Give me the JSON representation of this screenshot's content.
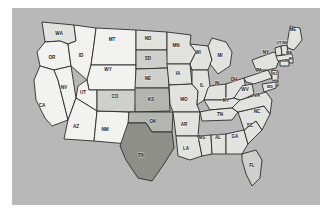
{
  "figure": {
    "kind": "us-choropleth-map",
    "background_color": "#ffffff",
    "panel_color": "#b8b8b8",
    "border_color": "#2b2b2b"
  },
  "chart_data": {
    "type": "heatmap",
    "title": "",
    "xlabel": "",
    "ylabel": "",
    "projection": "usa-albers",
    "grid": false,
    "legend_position": "none",
    "shade_palette": {
      "level0": "#f2f2f0",
      "level1": "#e2e2df",
      "level2": "#cfcfcb",
      "level3": "#b5b5b0",
      "level4": "#8f8f8a"
    },
    "categories": [
      "WA",
      "OR",
      "CA",
      "NV",
      "ID",
      "MT",
      "WY",
      "UT",
      "AZ",
      "NM",
      "CO",
      "ND",
      "SD",
      "NE",
      "KS",
      "OK",
      "TX",
      "MN",
      "IA",
      "MO",
      "AR",
      "LA",
      "WI",
      "IL",
      "MI",
      "IN",
      "OH",
      "KY",
      "TN",
      "MS",
      "AL",
      "GA",
      "FL",
      "SC",
      "NC",
      "VA",
      "WV",
      "PA",
      "NY",
      "VT",
      "NH",
      "ME",
      "MA",
      "RI",
      "CT",
      "NJ",
      "DE",
      "MD"
    ],
    "values": [
      1,
      0,
      0,
      0,
      0,
      0,
      0,
      0,
      0,
      0,
      2,
      1,
      2,
      2,
      3,
      3,
      4,
      1,
      1,
      1,
      1,
      1,
      1,
      1,
      1,
      1,
      1,
      1,
      1,
      1,
      1,
      1,
      2,
      1,
      1,
      1,
      1,
      1,
      1,
      1,
      1,
      1,
      1,
      1,
      1,
      1,
      1,
      1
    ],
    "labels": {
      "WA": "WA",
      "OR": "OR",
      "CA": "CA",
      "NV": "NV",
      "ID": "ID",
      "MT": "MT",
      "WY": "WY",
      "UT": "UT",
      "AZ": "AZ",
      "NM": "NM",
      "CO": "CO",
      "ND": "ND",
      "SD": "SD",
      "NE": "NE",
      "KS": "KS",
      "OK": "OK",
      "TX": "TX",
      "MN": "MN",
      "IA": "IA",
      "MO": "MO",
      "AR": "AR",
      "LA": "LA",
      "WI": "WI",
      "IL": "IL",
      "MI": "MI",
      "IN": "IN",
      "OH": "OH",
      "KY": "KY",
      "TN": "TN",
      "MS": "MS",
      "AL": "AL",
      "GA": "GA",
      "FL": "FL",
      "SC": "SC",
      "NC": "NC",
      "VA": "VA",
      "WV": "WV",
      "PA": "PA",
      "NY": "NY",
      "VT": "VT",
      "NH": "NH",
      "ME": "ME",
      "MA": "MA",
      "RI": "RI",
      "CT": "CT",
      "NJ": "NJ",
      "DE": "DE",
      "MD": "MD"
    }
  },
  "map": {
    "region_label": "United States",
    "states": [
      {
        "code": "WA",
        "label": "WA",
        "level": 1,
        "lx": 47,
        "ly": 26
      },
      {
        "code": "OR",
        "label": "OR",
        "level": 0,
        "lx": 40,
        "ly": 50
      },
      {
        "code": "CA",
        "label": "CA",
        "level": 0,
        "lx": 30,
        "ly": 98
      },
      {
        "code": "NV",
        "label": "NV",
        "level": 0,
        "lx": 52,
        "ly": 80
      },
      {
        "code": "ID",
        "label": "ID",
        "level": 0,
        "lx": 69,
        "ly": 48
      },
      {
        "code": "MT",
        "label": "MT",
        "level": 0,
        "lx": 100,
        "ly": 32
      },
      {
        "code": "WY",
        "label": "WY",
        "level": 0,
        "lx": 96,
        "ly": 62
      },
      {
        "code": "UT",
        "label": "UT",
        "level": 0,
        "lx": 71,
        "ly": 85
      },
      {
        "code": "AZ",
        "label": "AZ",
        "level": 0,
        "lx": 64,
        "ly": 119
      },
      {
        "code": "NM",
        "label": "NM",
        "level": 0,
        "lx": 93,
        "ly": 122
      },
      {
        "code": "CO",
        "label": "CO",
        "level": 2,
        "lx": 103,
        "ly": 89
      },
      {
        "code": "ND",
        "label": "ND",
        "level": 1,
        "lx": 136,
        "ly": 31
      },
      {
        "code": "SD",
        "label": "SD",
        "level": 2,
        "lx": 136,
        "ly": 51
      },
      {
        "code": "NE",
        "label": "NE",
        "level": 2,
        "lx": 136,
        "ly": 71
      },
      {
        "code": "KS",
        "label": "KS",
        "level": 3,
        "lx": 139,
        "ly": 92
      },
      {
        "code": "OK",
        "label": "OK",
        "level": 3,
        "lx": 141,
        "ly": 114
      },
      {
        "code": "TX",
        "label": "TX",
        "level": 4,
        "lx": 129,
        "ly": 148
      },
      {
        "code": "MN",
        "label": "MN",
        "level": 1,
        "lx": 164,
        "ly": 38
      },
      {
        "code": "IA",
        "label": "IA",
        "level": 1,
        "lx": 166,
        "ly": 66
      },
      {
        "code": "MO",
        "label": "MO",
        "level": 1,
        "lx": 172,
        "ly": 92
      },
      {
        "code": "AR",
        "label": "AR",
        "level": 1,
        "lx": 172,
        "ly": 117
      },
      {
        "code": "LA",
        "label": "LA",
        "level": 1,
        "lx": 174,
        "ly": 141
      },
      {
        "code": "WI",
        "label": "WI",
        "level": 1,
        "lx": 186,
        "ly": 45
      },
      {
        "code": "IL",
        "label": "IL",
        "level": 1,
        "lx": 190,
        "ly": 78
      },
      {
        "code": "MI",
        "label": "MI",
        "level": 1,
        "lx": 208,
        "ly": 48
      },
      {
        "code": "IN",
        "label": "IN",
        "level": 1,
        "lx": 205,
        "ly": 76
      },
      {
        "code": "OH",
        "label": "OH",
        "level": 1,
        "lx": 222,
        "ly": 72
      },
      {
        "code": "KY",
        "label": "KY",
        "level": 1,
        "lx": 214,
        "ly": 93
      },
      {
        "code": "TN",
        "label": "TN",
        "level": 1,
        "lx": 208,
        "ly": 107
      },
      {
        "code": "MS",
        "label": "MS",
        "level": 1,
        "lx": 190,
        "ly": 130
      },
      {
        "code": "AL",
        "label": "AL",
        "level": 1,
        "lx": 206,
        "ly": 130
      },
      {
        "code": "GA",
        "label": "GA",
        "level": 1,
        "lx": 223,
        "ly": 129
      },
      {
        "code": "FL",
        "label": "FL",
        "level": 2,
        "lx": 240,
        "ly": 158
      },
      {
        "code": "SC",
        "label": "SC",
        "level": 1,
        "lx": 238,
        "ly": 118
      },
      {
        "code": "NC",
        "label": "NC",
        "level": 1,
        "lx": 245,
        "ly": 104
      },
      {
        "code": "VA",
        "label": "VA",
        "level": 1,
        "lx": 245,
        "ly": 88
      },
      {
        "code": "WV",
        "label": "WV",
        "level": 1,
        "lx": 233,
        "ly": 82
      },
      {
        "code": "PA",
        "label": "PA",
        "level": 1,
        "lx": 247,
        "ly": 63
      },
      {
        "code": "NY",
        "label": "NY",
        "level": 1,
        "lx": 254,
        "ly": 45
      },
      {
        "code": "VT",
        "label": "VT",
        "level": 1,
        "lx": 267,
        "ly": 35
      },
      {
        "code": "NH",
        "label": "NH",
        "level": 1,
        "lx": 273,
        "ly": 35
      },
      {
        "code": "ME",
        "label": "ME",
        "level": 1,
        "lx": 281,
        "ly": 22
      },
      {
        "code": "MA",
        "label": "MA",
        "level": 1,
        "lx": 277,
        "ly": 45
      },
      {
        "code": "RI",
        "label": "RI",
        "level": 1,
        "lx": 279,
        "ly": 51
      },
      {
        "code": "CT",
        "label": "CT",
        "level": 1,
        "lx": 272,
        "ly": 53
      },
      {
        "code": "NJ",
        "label": "NJ",
        "level": 1,
        "lx": 263,
        "ly": 66
      },
      {
        "code": "DE",
        "label": "DE",
        "level": 1,
        "lx": 264,
        "ly": 74
      },
      {
        "code": "MD",
        "label": "MD",
        "level": 1,
        "lx": 258,
        "ly": 79
      }
    ]
  }
}
